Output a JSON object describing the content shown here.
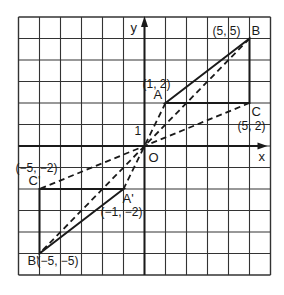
{
  "diagram": {
    "type": "coordinate-grid-dilation",
    "grid": {
      "x_range": [
        -6,
        6
      ],
      "y_range": [
        -6,
        6
      ],
      "step": 1
    },
    "axes": {
      "x_label": "x",
      "y_label": "y",
      "origin_label": "O",
      "unit_label": "1"
    },
    "points": [
      {
        "id": "A",
        "name": "A",
        "x": 1,
        "y": 2,
        "coord_label": "(1, 2)"
      },
      {
        "id": "B",
        "name": "B",
        "x": 5,
        "y": 5,
        "coord_label": "(5, 5)"
      },
      {
        "id": "C",
        "name": "C",
        "x": 5,
        "y": 2,
        "coord_label": "(5, 2)"
      },
      {
        "id": "A2",
        "name": "A'",
        "x": -1,
        "y": -2,
        "coord_label": "(−1, −2)"
      },
      {
        "id": "B2",
        "name": "B'",
        "x": -5,
        "y": -5,
        "coord_label": "(−5, −5)"
      },
      {
        "id": "C2",
        "name": "C'",
        "x": -5,
        "y": -2,
        "coord_label": "(−5, −2)"
      }
    ],
    "triangles": [
      {
        "name": "triangle-ABC",
        "vertices": [
          "A",
          "B",
          "C"
        ]
      },
      {
        "name": "triangle-A'B'C'",
        "vertices": [
          "A2",
          "B2",
          "C2"
        ]
      }
    ],
    "dashed_rays": [
      {
        "from": "A",
        "to": "A2"
      },
      {
        "from": "B",
        "to": "B2"
      },
      {
        "from": "C",
        "to": "C2"
      }
    ],
    "colors": {
      "ink": "#1a1a1a",
      "grid": "#333333"
    }
  }
}
